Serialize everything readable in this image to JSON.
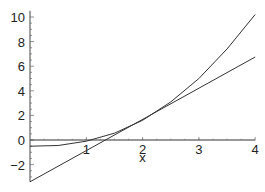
{
  "chart_data": {
    "type": "line",
    "title": "",
    "xlabel": "x",
    "ylabel": "",
    "xlim": [
      0,
      4
    ],
    "ylim": [
      -3.4,
      10.5
    ],
    "x_ticks": [
      1,
      2,
      3,
      4
    ],
    "y_ticks": [
      -2,
      0,
      2,
      4,
      6,
      8,
      10
    ],
    "grid": false,
    "legend": null,
    "series": [
      {
        "name": "curve",
        "x": [
          0,
          0.5,
          1,
          1.5,
          2,
          2.5,
          3,
          3.5,
          4
        ],
        "y": [
          -0.5,
          -0.45,
          -0.1,
          0.55,
          1.6,
          3.1,
          5.0,
          7.4,
          10.2
        ]
      },
      {
        "name": "tangent line",
        "x": [
          0,
          4
        ],
        "y": [
          -3.4,
          6.75
        ]
      },
      {
        "name": "horizontal line",
        "x": [
          0,
          4
        ],
        "y": [
          0,
          0
        ]
      }
    ]
  }
}
